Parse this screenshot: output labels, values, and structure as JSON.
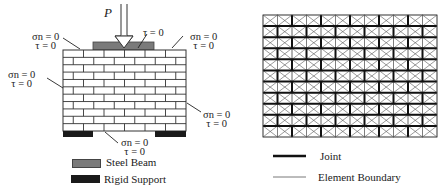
{
  "left_figure": {
    "load_label": "P",
    "wall": {
      "rows": 11,
      "bricks_per_row": 6
    },
    "boundary_labels": [
      {
        "id": "top-left",
        "line1": "σn = 0",
        "line2": "τ = 0"
      },
      {
        "id": "top-center",
        "line1": "τ = 0"
      },
      {
        "id": "top-right",
        "line1": "σn = 0",
        "line2": "τ = 0"
      },
      {
        "id": "left",
        "line1": "σn = 0",
        "line2": "τ = 0"
      },
      {
        "id": "right",
        "line1": "σn = 0",
        "line2": "τ = 0"
      },
      {
        "id": "bottom",
        "line1": "σn = 0",
        "line2": "τ = 0"
      }
    ],
    "legend": [
      {
        "label": "Steel Beam",
        "color": "#7a7a7a"
      },
      {
        "label": "Rigid Support",
        "color": "#1a1a1a"
      }
    ]
  },
  "right_figure": {
    "mesh": {
      "rows": 11,
      "columns": 12
    },
    "legend": [
      {
        "label": "Joint",
        "line_style": "thick"
      },
      {
        "label": "Element Boundary",
        "line_style": "thin"
      }
    ]
  },
  "colors": {
    "steel_beam": "#7a7a7a",
    "rigid_support": "#1a1a1a",
    "line": "#333333"
  }
}
